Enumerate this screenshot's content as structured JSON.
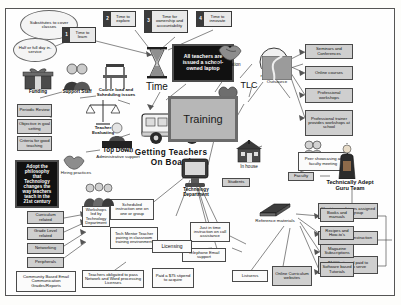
{
  "diagram": {
    "title": "Getting Teachers On Board",
    "center_labels": {
      "time": "Time",
      "training": "Training",
      "tlc": "TLC",
      "in_house": "In house",
      "outsource": "Outsource",
      "cooperation": "Cooperation",
      "positive_reinforcement": "Positive reinforcement",
      "faculty": "Faculty",
      "students": "Students",
      "technology_department": "Technology Department",
      "reference_materials": "Reference materials",
      "licensing": "Licensing",
      "technically_adept_guru_team": "Technically Adept Guru Team",
      "top_down": "Top Down",
      "top_down_sub": "Administrative support",
      "teacher_evaluating": "Teacher Evaluating",
      "hiring_practices": "Hiring practices",
      "funding": "Funding",
      "support_staff": "Support Staff",
      "course_load": "Course load and Scheduling issues"
    },
    "numbered_steps": [
      {
        "n": "1",
        "label": "Time to learn"
      },
      {
        "n": "2",
        "label": "Time to explore"
      },
      {
        "n": "3",
        "label": "Time for ownership and accountability"
      },
      {
        "n": "4",
        "label": "Time to innovate"
      }
    ],
    "clouds": [
      {
        "text": "Substitutes to cover classes"
      },
      {
        "text": "Half or full day in-service"
      }
    ],
    "black_panels": [
      {
        "text": "All teachers are issued a school-owned laptop"
      },
      {
        "text": "Adopt the philosophy that Technology changes the way teachers teach in the 21st century"
      }
    ],
    "evaluation_boxes": [
      {
        "text": "Periodic Review"
      },
      {
        "text": "Objective in goal setting"
      },
      {
        "text": "Criteria for good teaching"
      }
    ],
    "training_topic_boxes": [
      {
        "text": "Curriculum related"
      },
      {
        "text": "Grade Level related"
      },
      {
        "text": "Networking"
      },
      {
        "text": "Peripherals"
      }
    ],
    "community_box": {
      "text": "Community Based Email Communication Grades/Reports"
    },
    "reinforcement_boxes": [
      {
        "text": "Seminars and Conferences"
      },
      {
        "text": "Online courses"
      },
      {
        "text": "Professional workshops"
      },
      {
        "text": "Professional trainer provides workshops at school"
      }
    ],
    "peer_box": {
      "text": "Peer showcasing at faculty meeting"
    },
    "tech_dept_boxes": [
      {
        "text": "Scheduled instruction one on one or group"
      },
      {
        "text": "Workshops led by Technology Department"
      },
      {
        "text": "Tech Mentor Teacher pairing in classroom training environment"
      },
      {
        "text": "Just in time instruction on call assistance"
      },
      {
        "text": "Telephone Email support"
      }
    ],
    "licensing_boxes": [
      {
        "text": "Teachers obligated to pass Network and Word processing Licenses"
      },
      {
        "text": "Paid a $75 stipend to acquire"
      }
    ],
    "reference_boxes": [
      {
        "text": "Books and manuals"
      },
      {
        "text": "Recipes and How-to's"
      },
      {
        "text": "Magazine Subscriptions"
      },
      {
        "text": "Software based Tutorials"
      },
      {
        "text": "Listservs"
      },
      {
        "text": "Online Curriculum websites"
      }
    ],
    "guru_boxes": [
      {
        "text": "Short term advisors assigned to cover a group"
      },
      {
        "text": "Provide on-call instruction"
      },
      {
        "text": "$1000 stipend paid to teachers who serve"
      }
    ],
    "icons": [
      "hourglass-icon",
      "school-bus-icon",
      "chalkboard-icon",
      "computer-monitor-icon",
      "handshake-icon",
      "smiley-face-icon",
      "heart-icon",
      "gift-icon",
      "people-icon",
      "desk-chair-icon",
      "scales-icon",
      "judge-icon",
      "road-icon",
      "schoolhouse-icon",
      "two-heads-icon",
      "book-icon",
      "person-at-desk-icon",
      "group-of-people-icon",
      "robed-figure-icon"
    ]
  }
}
